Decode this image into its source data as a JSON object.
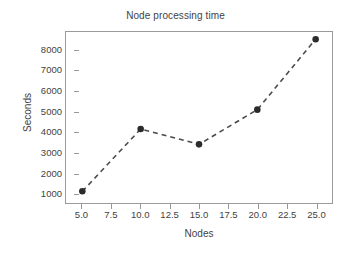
{
  "chart_data": {
    "type": "line",
    "title": "Node processing time",
    "xlabel": "Nodes",
    "ylabel": "Seconds",
    "x": [
      5,
      10,
      15,
      20,
      25
    ],
    "values": [
      1100,
      4150,
      3400,
      5100,
      8550
    ],
    "series": [
      {
        "name": "Node processing time",
        "values": [
          1100,
          4150,
          3400,
          5100,
          8550
        ]
      }
    ],
    "xlim": [
      3.6,
      26.4
    ],
    "ylim": [
      530,
      8900
    ],
    "xticks": [
      5,
      7.5,
      10,
      12.5,
      15,
      17.5,
      20,
      22.5,
      25
    ],
    "xtick_labels": [
      "5.0",
      "7.5",
      "10.0",
      "12.5",
      "15.0",
      "17.5",
      "20.0",
      "22.5",
      "25.0"
    ],
    "yticks": [
      1000,
      2000,
      3000,
      4000,
      5000,
      6000,
      7000,
      8000
    ],
    "ytick_labels": [
      "1000",
      "2000",
      "3000",
      "4000",
      "5000",
      "6000",
      "7000",
      "8000"
    ],
    "grid": false,
    "legend": false,
    "line_style": "dashed",
    "marker": "circle",
    "line_color": "#4a4a4a",
    "marker_color": "#2b2b2b",
    "frame_color": "#9a9a9a",
    "background_color": "#ffffff"
  }
}
